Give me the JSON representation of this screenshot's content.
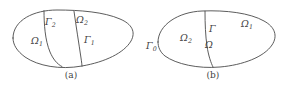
{
  "document": {
    "kind": "mathematical-figure",
    "background_color": "#ffffff",
    "stroke_color": "#4a4a4a",
    "text_color": "#3f3f3f"
  },
  "figures": [
    {
      "id": "a",
      "caption": "(a)",
      "description": "Oval domain subdivided by two interior interface curves into sub-regions",
      "labels": [
        {
          "name": "omega-1",
          "base": "Ω",
          "sub": "1",
          "x": 31,
          "y": 36
        },
        {
          "name": "omega-2",
          "base": "Ω",
          "sub": "2",
          "x": 76,
          "y": 15
        },
        {
          "name": "gamma-2",
          "base": "Γ",
          "sub": "2",
          "x": 45,
          "y": 17
        },
        {
          "name": "gamma-1",
          "base": "Γ",
          "sub": "1",
          "x": 84,
          "y": 35
        }
      ]
    },
    {
      "id": "b",
      "caption": "(b)",
      "description": "Oval domain split by a single interior interface curve into two sub-regions",
      "labels": [
        {
          "name": "gamma-0",
          "base": "Γ",
          "sub": "0",
          "x": 4,
          "y": 41
        },
        {
          "name": "omega-2",
          "base": "Ω",
          "sub": "2",
          "x": 38,
          "y": 33
        },
        {
          "name": "gamma",
          "base": "Γ",
          "sub": "",
          "x": 67,
          "y": 24
        },
        {
          "name": "omega",
          "base": "Ω",
          "sub": "",
          "x": 63,
          "y": 40
        },
        {
          "name": "omega-1",
          "base": "Ω",
          "sub": "1",
          "x": 99,
          "y": 19
        }
      ]
    }
  ]
}
